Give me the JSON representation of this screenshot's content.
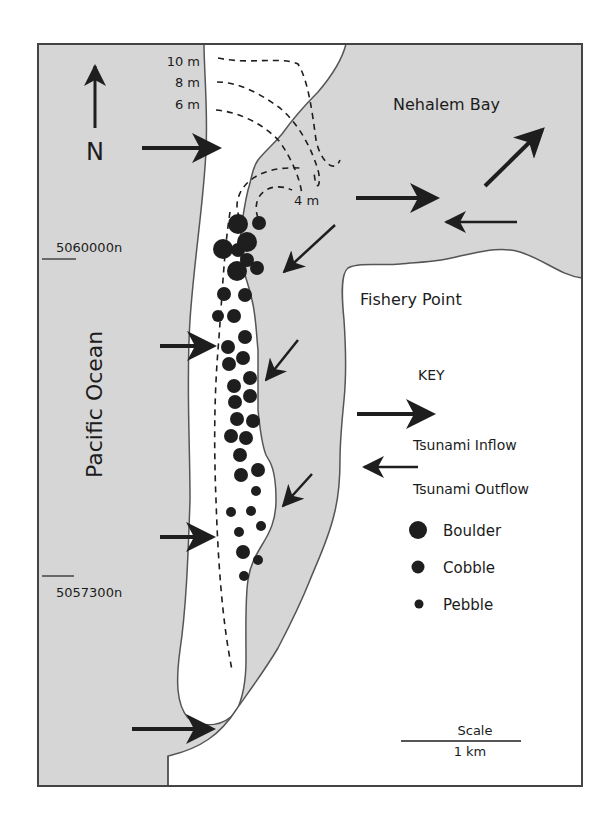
{
  "figure": {
    "title_cropped": "",
    "colors": {
      "water": "#d6d6d6",
      "land": "#ffffff",
      "outline": "#555555",
      "arrow": "#1e1e1e",
      "clast": "#1e1e1e",
      "frame": "#444444"
    }
  },
  "labels": {
    "north": "N",
    "contour_10": "10 m",
    "contour_8": "8 m",
    "contour_6": "6 m",
    "contour_4": "4 m",
    "bay": "Nehalem Bay",
    "point": "Fishery Point",
    "ocean": "Pacific Ocean",
    "northing_upper": "5060000n",
    "northing_lower": "5057300n"
  },
  "key": {
    "title": "KEY",
    "items": [
      {
        "symbol": "large-arrow",
        "label": "Tsunami Inflow"
      },
      {
        "symbol": "small-arrow",
        "label": "Tsunami Outflow"
      },
      {
        "symbol": "large-dot",
        "label": "Boulder"
      },
      {
        "symbol": "medium-dot",
        "label": "Cobble"
      },
      {
        "symbol": "small-dot",
        "label": "Pebble"
      }
    ]
  },
  "scale": {
    "title": "Scale",
    "length": "1 km"
  }
}
